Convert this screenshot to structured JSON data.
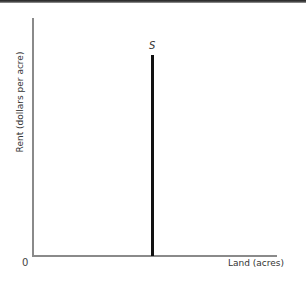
{
  "chart_data": {
    "type": "line",
    "title": "",
    "xlabel": "Land (acres)",
    "ylabel": "Rent (dollars per acre)",
    "origin_label": "0",
    "series": [
      {
        "name": "S",
        "label": "S",
        "description": "Perfectly inelastic (vertical) supply of land",
        "x": [
          0.5,
          0.5
        ],
        "y": [
          0,
          0.85
        ]
      }
    ],
    "xlim": [
      0,
      1
    ],
    "ylim": [
      0,
      1
    ],
    "grid": false,
    "legend": "none",
    "colors": {
      "supply": "#111111",
      "axes": "#8a8a8a"
    }
  }
}
